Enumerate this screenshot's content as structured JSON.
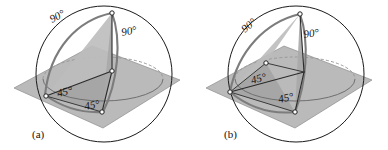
{
  "figure": {
    "kind": "geometry-diagram",
    "background_color": "#ffffff",
    "ink_color": "#111111",
    "plane_color": "#b4b4b4",
    "arc_color": "#7c7c7c",
    "sphere_stroke_color": "#1a1a1a"
  },
  "panels": [
    {
      "id": "a",
      "caption": "(a)",
      "labels": [
        {
          "name": "arc-angle-left",
          "text": "90°",
          "x": 52,
          "y": 23
        },
        {
          "name": "arc-angle-right",
          "text": "90°",
          "x": 122,
          "y": 36
        },
        {
          "name": "plane-angle-left",
          "text": "45°",
          "x": 58,
          "y": 97
        },
        {
          "name": "plane-angle-right",
          "text": "45°",
          "x": 85,
          "y": 110
        }
      ]
    },
    {
      "id": "b",
      "caption": "(b)",
      "labels": [
        {
          "name": "arc-angle-left",
          "text": "90°",
          "x": 51,
          "y": 33
        },
        {
          "name": "arc-angle-right",
          "text": "90°",
          "x": 110,
          "y": 38
        },
        {
          "name": "plane-angle-left",
          "text": "45°",
          "x": 58,
          "y": 84
        },
        {
          "name": "plane-angle-right",
          "text": "45°",
          "x": 85,
          "y": 103
        }
      ]
    }
  ],
  "annotations": {
    "right_angle": "90°",
    "half_right_angle": "45°",
    "caption_a": "(a)",
    "caption_b": "(b)"
  }
}
